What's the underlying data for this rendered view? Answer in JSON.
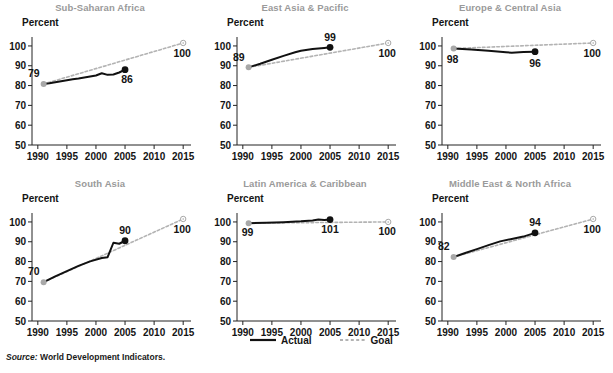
{
  "figure": {
    "source_label": "Source:",
    "source_text": "World Development Indicators.",
    "y_axis_title": "Percent"
  },
  "legend": {
    "actual_label": "Actual",
    "goal_label": "Goal",
    "actual_color": "#111111",
    "goal_color": "#b3b3b3"
  },
  "chart_data": [
    {
      "type": "line",
      "title": "Sub-Saharan Africa",
      "ylabel": "Percent",
      "xlabel": "",
      "xlim": [
        1989,
        2016
      ],
      "ylim": [
        50,
        103
      ],
      "yticks": [
        50,
        60,
        70,
        80,
        90,
        100
      ],
      "xticks": [
        1990,
        1995,
        2000,
        2005,
        2010,
        2015
      ],
      "grid": false,
      "legend_position": "figure-bottom-center",
      "annotations": [
        {
          "text": "79",
          "x": 1991,
          "y": 81,
          "placement": "above-left"
        },
        {
          "text": "86",
          "x": 2005,
          "y": 88,
          "placement": "below-right"
        },
        {
          "text": "100",
          "x": 2015,
          "y": 101,
          "placement": "below-left"
        }
      ],
      "series": [
        {
          "name": "Actual",
          "style": "solid",
          "color": "#111111",
          "x": [
            1991,
            1992,
            1993,
            1994,
            1995,
            1996,
            1997,
            1998,
            1999,
            2000,
            2001,
            2002,
            2003,
            2004,
            2005
          ],
          "values": [
            80.8,
            81.2,
            81.7,
            82.2,
            82.7,
            83.2,
            83.6,
            84.1,
            84.6,
            85.1,
            86.2,
            85.4,
            85.6,
            86.6,
            88.0
          ],
          "endpoint_marker": "filled-circle",
          "startpoint_marker": "gray-circle"
        },
        {
          "name": "Goal",
          "style": "dashed",
          "color": "#b3b3b3",
          "x": [
            1991,
            2015
          ],
          "values": [
            80.8,
            101.5
          ],
          "endpoint_marker": "open-circle"
        }
      ]
    },
    {
      "type": "line",
      "title": "East Asia & Pacific",
      "ylabel": "Percent",
      "xlabel": "",
      "xlim": [
        1989,
        2016
      ],
      "ylim": [
        50,
        103
      ],
      "yticks": [
        50,
        60,
        70,
        80,
        90,
        100
      ],
      "xticks": [
        1990,
        1995,
        2000,
        2005,
        2010,
        2015
      ],
      "grid": false,
      "annotations": [
        {
          "text": "89",
          "x": 1991,
          "y": 89,
          "placement": "above-left"
        },
        {
          "text": "99",
          "x": 2005,
          "y": 99,
          "placement": "above"
        },
        {
          "text": "100",
          "x": 2015,
          "y": 101,
          "placement": "below-left"
        }
      ],
      "series": [
        {
          "name": "Actual",
          "style": "solid",
          "color": "#111111",
          "x": [
            1991,
            1993,
            1995,
            1997,
            1999,
            2000,
            2002,
            2004,
            2005
          ],
          "values": [
            89.2,
            91.0,
            93.0,
            95.0,
            96.8,
            97.6,
            98.4,
            99.0,
            99.3
          ],
          "endpoint_marker": "filled-circle",
          "startpoint_marker": "gray-circle"
        },
        {
          "name": "Goal",
          "style": "dashed",
          "color": "#b3b3b3",
          "x": [
            1991,
            2015
          ],
          "values": [
            89.2,
            101.5
          ],
          "endpoint_marker": "open-circle"
        }
      ]
    },
    {
      "type": "line",
      "title": "Europe & Central Asia",
      "ylabel": "Percent",
      "xlabel": "",
      "xlim": [
        1989,
        2016
      ],
      "ylim": [
        50,
        103
      ],
      "yticks": [
        50,
        60,
        70,
        80,
        90,
        100
      ],
      "xticks": [
        1990,
        1995,
        2000,
        2005,
        2010,
        2015
      ],
      "grid": false,
      "annotations": [
        {
          "text": "98",
          "x": 1991,
          "y": 98,
          "placement": "below-left"
        },
        {
          "text": "96",
          "x": 2005,
          "y": 96,
          "placement": "below"
        },
        {
          "text": "100",
          "x": 2015,
          "y": 101,
          "placement": "below-left"
        }
      ],
      "series": [
        {
          "name": "Actual",
          "style": "solid",
          "color": "#111111",
          "x": [
            1991,
            1994,
            1997,
            2000,
            2001,
            2003,
            2005
          ],
          "values": [
            98.7,
            98.2,
            97.6,
            96.8,
            96.6,
            96.9,
            97.1
          ],
          "endpoint_marker": "filled-circle",
          "startpoint_marker": "gray-circle"
        },
        {
          "name": "Goal",
          "style": "dashed",
          "color": "#b3b3b3",
          "x": [
            1991,
            2015
          ],
          "values": [
            98.7,
            101.5
          ],
          "endpoint_marker": "open-circle"
        }
      ]
    },
    {
      "type": "line",
      "title": "South Asia",
      "ylabel": "Percent",
      "xlabel": "",
      "xlim": [
        1989,
        2016
      ],
      "ylim": [
        50,
        103
      ],
      "yticks": [
        50,
        60,
        70,
        80,
        90,
        100
      ],
      "xticks": [
        1990,
        1995,
        2000,
        2005,
        2010,
        2015
      ],
      "grid": false,
      "annotations": [
        {
          "text": "70",
          "x": 1991,
          "y": 69.6,
          "placement": "above-left"
        },
        {
          "text": "90",
          "x": 2005,
          "y": 90.5,
          "placement": "above"
        },
        {
          "text": "100",
          "x": 2015,
          "y": 101,
          "placement": "below-left"
        }
      ],
      "series": [
        {
          "name": "Actual",
          "style": "solid",
          "color": "#111111",
          "x": [
            1991,
            1993,
            1995,
            1997,
            1999,
            2001,
            2002,
            2003,
            2004,
            2005
          ],
          "values": [
            69.6,
            72.5,
            75.2,
            77.8,
            80.1,
            81.8,
            82.2,
            89.5,
            89.0,
            90.5
          ],
          "endpoint_marker": "filled-circle",
          "startpoint_marker": "gray-circle"
        },
        {
          "name": "Goal",
          "style": "dashed",
          "color": "#b3b3b3",
          "x": [
            1991,
            2015
          ],
          "values": [
            69.6,
            101.5
          ],
          "endpoint_marker": "open-circle"
        }
      ]
    },
    {
      "type": "line",
      "title": "Latin America & Caribbean",
      "ylabel": "Percent",
      "xlabel": "",
      "xlim": [
        1989,
        2016
      ],
      "ylim": [
        50,
        103
      ],
      "yticks": [
        50,
        60,
        70,
        80,
        90,
        100
      ],
      "xticks": [
        1990,
        1995,
        2000,
        2005,
        2010,
        2015
      ],
      "grid": false,
      "annotations": [
        {
          "text": "99",
          "x": 1991,
          "y": 99.4,
          "placement": "below-left"
        },
        {
          "text": "101",
          "x": 2005,
          "y": 101,
          "placement": "below"
        },
        {
          "text": "100",
          "x": 2015,
          "y": 100,
          "placement": "below-left"
        }
      ],
      "series": [
        {
          "name": "Actual",
          "style": "solid",
          "color": "#111111",
          "x": [
            1991,
            1994,
            1997,
            2000,
            2002,
            2003,
            2004,
            2005
          ],
          "values": [
            99.4,
            99.6,
            99.9,
            100.3,
            100.7,
            101.2,
            101.0,
            101.2
          ],
          "endpoint_marker": "filled-circle",
          "startpoint_marker": "gray-circle"
        },
        {
          "name": "Goal",
          "style": "dashed",
          "color": "#b3b3b3",
          "x": [
            1991,
            2015
          ],
          "values": [
            99.4,
            100.0
          ],
          "endpoint_marker": "open-circle"
        }
      ]
    },
    {
      "type": "line",
      "title": "Middle East & North Africa",
      "ylabel": "Percent",
      "xlabel": "",
      "xlim": [
        1989,
        2016
      ],
      "ylim": [
        50,
        103
      ],
      "yticks": [
        50,
        60,
        70,
        80,
        90,
        100
      ],
      "xticks": [
        1990,
        1995,
        2000,
        2005,
        2010,
        2015
      ],
      "grid": false,
      "annotations": [
        {
          "text": "82",
          "x": 1991,
          "y": 82.3,
          "placement": "above-left"
        },
        {
          "text": "94",
          "x": 2005,
          "y": 94.5,
          "placement": "above"
        },
        {
          "text": "100",
          "x": 2015,
          "y": 101,
          "placement": "below-left"
        }
      ],
      "series": [
        {
          "name": "Actual",
          "style": "solid",
          "color": "#111111",
          "x": [
            1991,
            1993,
            1995,
            1997,
            1999,
            2001,
            2003,
            2005
          ],
          "values": [
            82.3,
            84.3,
            86.3,
            88.3,
            90.2,
            91.4,
            92.6,
            94.5
          ],
          "endpoint_marker": "filled-circle",
          "startpoint_marker": "gray-circle"
        },
        {
          "name": "Goal",
          "style": "dashed",
          "color": "#b3b3b3",
          "x": [
            1991,
            2015
          ],
          "values": [
            82.3,
            101.5
          ],
          "endpoint_marker": "open-circle"
        }
      ]
    }
  ]
}
